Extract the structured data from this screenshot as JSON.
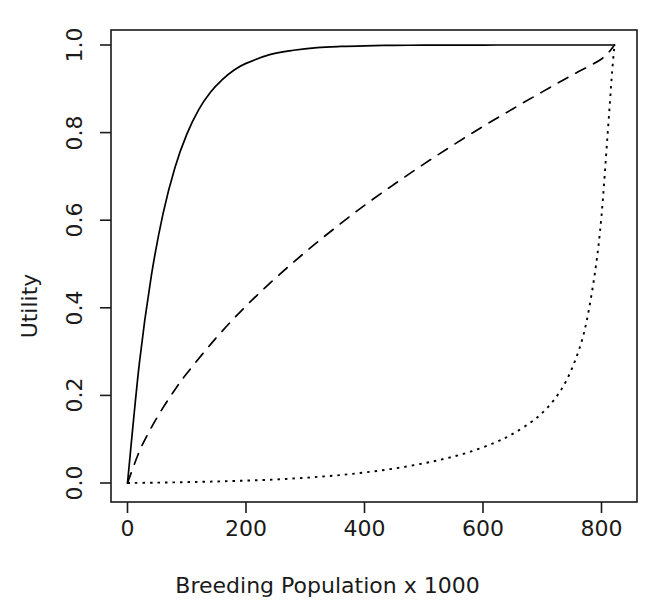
{
  "chart_data": {
    "type": "line",
    "title": "",
    "xlabel": "Breeding Population x 1000",
    "ylabel": "Utility",
    "xlim": [
      -20,
      860
    ],
    "ylim": [
      -0.02,
      1.02
    ],
    "xticks": [
      0,
      200,
      400,
      600,
      800
    ],
    "xtick_labels": [
      "0",
      "200",
      "400",
      "600",
      "800"
    ],
    "yticks": [
      0.0,
      0.2,
      0.4,
      0.6,
      0.8,
      1.0
    ],
    "ytick_labels": [
      "0.0",
      "0.2",
      "0.4",
      "0.6",
      "0.8",
      "1.0"
    ],
    "grid": false,
    "legend": "none",
    "box": true,
    "x_max_data": 822,
    "line_color": "#000000",
    "series": [
      {
        "name": "concave-risk-averse",
        "style": "solid",
        "dasharray": "none",
        "x": [
          0,
          20,
          40,
          60,
          80,
          100,
          120,
          140,
          160,
          180,
          200,
          240,
          280,
          320,
          360,
          400,
          450,
          500,
          550,
          600,
          650,
          700,
          750,
          800,
          822
        ],
        "y": [
          0.0,
          0.273,
          0.471,
          0.615,
          0.72,
          0.796,
          0.852,
          0.892,
          0.921,
          0.943,
          0.958,
          0.978,
          0.988,
          0.994,
          0.9967,
          0.9982,
          0.9992,
          0.9996,
          0.9998,
          0.9999,
          1.0,
          1.0,
          1.0,
          1.0,
          1.0
        ]
      },
      {
        "name": "mildly-concave",
        "style": "dashed",
        "dasharray": "11,9",
        "x": [
          0,
          20,
          40,
          60,
          80,
          100,
          150,
          200,
          250,
          300,
          350,
          400,
          450,
          500,
          550,
          600,
          650,
          700,
          750,
          800,
          822
        ],
        "y": [
          0.0,
          0.072,
          0.126,
          0.172,
          0.213,
          0.25,
          0.332,
          0.404,
          0.468,
          0.527,
          0.582,
          0.634,
          0.682,
          0.728,
          0.772,
          0.814,
          0.854,
          0.893,
          0.931,
          0.968,
          1.0
        ]
      },
      {
        "name": "convex-risk-prone",
        "style": "dotted",
        "dasharray": "2.5,5",
        "x": [
          0,
          50,
          100,
          150,
          200,
          250,
          300,
          350,
          400,
          450,
          500,
          540,
          580,
          620,
          650,
          680,
          700,
          720,
          740,
          760,
          775,
          790,
          800,
          810,
          818,
          822
        ],
        "y": [
          0.0,
          0.0008,
          0.002,
          0.0035,
          0.0055,
          0.008,
          0.012,
          0.017,
          0.024,
          0.033,
          0.045,
          0.057,
          0.072,
          0.092,
          0.112,
          0.138,
          0.16,
          0.19,
          0.232,
          0.296,
          0.37,
          0.49,
          0.61,
          0.79,
          0.94,
          1.0
        ]
      }
    ]
  },
  "axes": {
    "x_title": "Breeding Population x 1000",
    "y_title": "Utility"
  }
}
